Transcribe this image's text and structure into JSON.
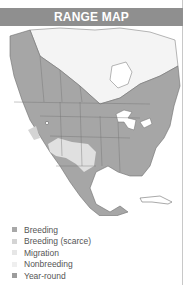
{
  "header": {
    "title": "RANGE MAP"
  },
  "colors": {
    "header_bg": "#8f8f8f",
    "year_round": "#a6a6a6",
    "breeding": "#a6a6a6",
    "breeding_scarce": "#d9d9d9",
    "migration": "#e3e3e3",
    "nonbreeding": "#eeeeee",
    "water": "#ffffff",
    "border_lines": "#6e6e6e"
  },
  "legend": {
    "items": [
      {
        "label": "Breeding",
        "color": "#a8a8a8"
      },
      {
        "label": "Breeding (scarce)",
        "color": "#d4d4d4"
      },
      {
        "label": "Migration",
        "color": "#e6e6e6"
      },
      {
        "label": "Nonbreeding",
        "color": "#efefef"
      },
      {
        "label": "Year-round",
        "color": "#9c9c9c"
      }
    ]
  }
}
